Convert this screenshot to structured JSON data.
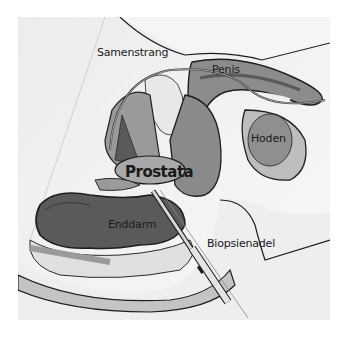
{
  "diagram": {
    "labels": {
      "samenstrang": "Samenstrang",
      "penis": "Penis",
      "hoden": "Hoden",
      "prostata": "Prostata",
      "enddarm": "Enddarm",
      "biopsienadel": "Biopsienadel"
    },
    "colors": {
      "background": "#f3f3f3",
      "skin": "#e6e6e6",
      "tissue_dark": "#5a5a5a",
      "tissue_mid": "#8c8c8c",
      "tissue_light": "#c8c8c8",
      "outline": "#1e1e1e",
      "needle": "#d8d8d8"
    }
  }
}
